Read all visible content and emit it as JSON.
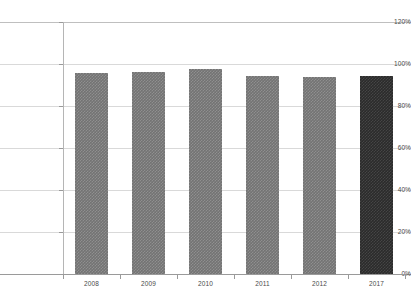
{
  "chart_data": {
    "type": "bar",
    "title": "",
    "subtitle": "",
    "xlabel": "",
    "ylabel": "",
    "categories": [
      "2008",
      "2009",
      "2010",
      "2011",
      "2012",
      "2017"
    ],
    "values": [
      95.5,
      96.0,
      97.5,
      94.5,
      94.0,
      94.5
    ],
    "value_format": "percent",
    "ylim": [
      0,
      120
    ],
    "ytick_labels": [
      "0%",
      "20%",
      "40%",
      "60%",
      "80%",
      "100%",
      "120%"
    ],
    "ytick_values": [
      0,
      20,
      40,
      60,
      80,
      100,
      120
    ],
    "grid": true,
    "grid_axis": "y",
    "legend": false,
    "legend_position": "none",
    "series": [
      {
        "name": "",
        "values": [
          95.5,
          96.0,
          97.5,
          94.5,
          94.0,
          94.5
        ]
      }
    ],
    "bar_colors": [
      "#737373",
      "#737373",
      "#737373",
      "#737373",
      "#737373",
      "#2b2b2b"
    ],
    "highlight_category": "2017",
    "colors": {
      "bar_default": "#737373",
      "bar_highlight": "#2b2b2b",
      "gridline": "#d9d9d9",
      "axis": "#9a9a9a",
      "text": "#4a4a4a",
      "background": "#ffffff"
    }
  }
}
